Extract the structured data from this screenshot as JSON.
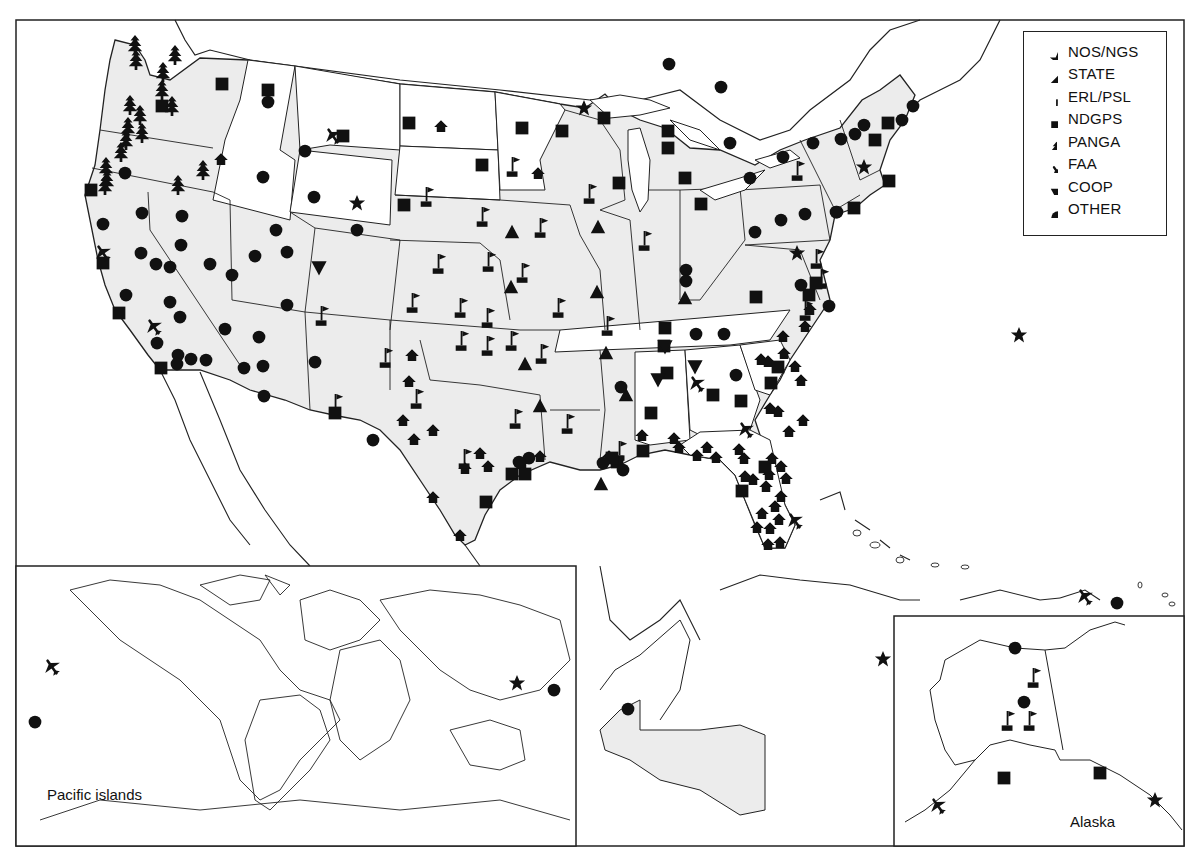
{
  "figure": {
    "frame": {
      "x": 16,
      "y": 20,
      "width": 1168,
      "height": 826
    },
    "colors": {
      "land_shaded": "#ececec",
      "land_unshaded": "#ffffff",
      "outline": "#222222",
      "symbol": "#111111",
      "background": "#ffffff"
    }
  },
  "legend": {
    "items": [
      {
        "key": "nos_ngs",
        "label": "NOS/NGS",
        "icon": "star-icon"
      },
      {
        "key": "state",
        "label": "STATE",
        "icon": "house-icon"
      },
      {
        "key": "erl_psl",
        "label": "ERL/PSL",
        "icon": "flag-icon"
      },
      {
        "key": "ndgps",
        "label": "NDGPS",
        "icon": "square-icon"
      },
      {
        "key": "panga",
        "label": "PANGA",
        "icon": "tree-icon"
      },
      {
        "key": "faa",
        "label": "FAA",
        "icon": "airplane-icon"
      },
      {
        "key": "coop",
        "label": "COOP",
        "icon": "triangle-down-icon"
      },
      {
        "key": "other",
        "label": "OTHER",
        "icon": "circle-icon"
      }
    ]
  },
  "insets": {
    "pacific": {
      "label": "Pacific islands",
      "x": 16,
      "y": 566,
      "width": 560,
      "height": 280
    },
    "alaska": {
      "label": "Alaska",
      "x": 894,
      "y": 616,
      "width": 290,
      "height": 230
    }
  },
  "stations": {
    "nos_ngs": [
      [
        357,
        203
      ],
      [
        584,
        108
      ],
      [
        864,
        167
      ],
      [
        797,
        253
      ],
      [
        1019,
        335
      ],
      [
        883,
        659
      ],
      [
        517,
        683
      ],
      [
        1155,
        800
      ]
    ],
    "state": [
      [
        221,
        160
      ],
      [
        441,
        127
      ],
      [
        538,
        174
      ],
      [
        403,
        421
      ],
      [
        433,
        431
      ],
      [
        409,
        382
      ],
      [
        412,
        356
      ],
      [
        414,
        440
      ],
      [
        480,
        454
      ],
      [
        488,
        467
      ],
      [
        465,
        469
      ],
      [
        460,
        536
      ],
      [
        433,
        498
      ],
      [
        522,
        464
      ],
      [
        540,
        457
      ],
      [
        609,
        457
      ],
      [
        642,
        436
      ],
      [
        674,
        439
      ],
      [
        679,
        448
      ],
      [
        697,
        456
      ],
      [
        707,
        448
      ],
      [
        716,
        458
      ],
      [
        739,
        450
      ],
      [
        744,
        459
      ],
      [
        753,
        480
      ],
      [
        772,
        459
      ],
      [
        769,
        475
      ],
      [
        781,
        467
      ],
      [
        786,
        479
      ],
      [
        778,
        412
      ],
      [
        770,
        409
      ],
      [
        789,
        432
      ],
      [
        803,
        421
      ],
      [
        805,
        327
      ],
      [
        783,
        337
      ],
      [
        784,
        354
      ],
      [
        795,
        367
      ],
      [
        801,
        381
      ],
      [
        810,
        310
      ],
      [
        768,
        362
      ],
      [
        761,
        360
      ],
      [
        766,
        487
      ],
      [
        770,
        529
      ],
      [
        779,
        520
      ],
      [
        768,
        545
      ],
      [
        780,
        543
      ],
      [
        757,
        528
      ],
      [
        762,
        514
      ],
      [
        775,
        507
      ],
      [
        781,
        497
      ],
      [
        745,
        477
      ]
    ],
    "state_triangle": [
      [
        512,
        232
      ],
      [
        598,
        227
      ],
      [
        511,
        287
      ],
      [
        597,
        292
      ],
      [
        525,
        364
      ],
      [
        606,
        353
      ],
      [
        685,
        298
      ],
      [
        626,
        395
      ],
      [
        540,
        406
      ],
      [
        601,
        484
      ]
    ],
    "erl_psl": [
      [
        427,
        196
      ],
      [
        483,
        216
      ],
      [
        541,
        227
      ],
      [
        513,
        166
      ],
      [
        590,
        193
      ],
      [
        645,
        240
      ],
      [
        439,
        263
      ],
      [
        489,
        261
      ],
      [
        413,
        302
      ],
      [
        461,
        307
      ],
      [
        488,
        317
      ],
      [
        523,
        272
      ],
      [
        559,
        307
      ],
      [
        462,
        340
      ],
      [
        488,
        345
      ],
      [
        512,
        340
      ],
      [
        542,
        353
      ],
      [
        608,
        325
      ],
      [
        386,
        357
      ],
      [
        322,
        315
      ],
      [
        336,
        403
      ],
      [
        417,
        398
      ],
      [
        465,
        458
      ],
      [
        516,
        418
      ],
      [
        568,
        423
      ],
      [
        620,
        450
      ],
      [
        1008,
        720
      ],
      [
        1030,
        720
      ],
      [
        1034,
        677
      ],
      [
        798,
        170
      ],
      [
        817,
        258
      ],
      [
        822,
        278
      ],
      [
        806,
        310
      ]
    ],
    "ndgps": [
      [
        222,
        84
      ],
      [
        268,
        90
      ],
      [
        162,
        106
      ],
      [
        343,
        136
      ],
      [
        409,
        123
      ],
      [
        482,
        165
      ],
      [
        522,
        128
      ],
      [
        562,
        131
      ],
      [
        604,
        118
      ],
      [
        619,
        183
      ],
      [
        668,
        131
      ],
      [
        668,
        148
      ],
      [
        685,
        178
      ],
      [
        701,
        204
      ],
      [
        404,
        205
      ],
      [
        91,
        190
      ],
      [
        103,
        263
      ],
      [
        119,
        313
      ],
      [
        161,
        368
      ],
      [
        335,
        413
      ],
      [
        665,
        328
      ],
      [
        664,
        346
      ],
      [
        667,
        373
      ],
      [
        651,
        413
      ],
      [
        643,
        451
      ],
      [
        617,
        462
      ],
      [
        612,
        458
      ],
      [
        512,
        474
      ],
      [
        525,
        474
      ],
      [
        486,
        502
      ],
      [
        756,
        297
      ],
      [
        809,
        295
      ],
      [
        816,
        283
      ],
      [
        713,
        395
      ],
      [
        741,
        401
      ],
      [
        771,
        383
      ],
      [
        778,
        367
      ],
      [
        742,
        491
      ],
      [
        765,
        467
      ],
      [
        888,
        123
      ],
      [
        875,
        140
      ],
      [
        889,
        181
      ],
      [
        854,
        208
      ],
      [
        1004,
        778
      ],
      [
        1100,
        773
      ]
    ],
    "panga": [
      [
        135,
        45
      ],
      [
        136,
        60
      ],
      [
        163,
        72
      ],
      [
        175,
        55
      ],
      [
        140,
        115
      ],
      [
        162,
        90
      ],
      [
        172,
        106
      ],
      [
        126,
        140
      ],
      [
        128,
        127
      ],
      [
        106,
        167
      ],
      [
        107,
        180
      ],
      [
        105,
        185
      ],
      [
        121,
        152
      ],
      [
        142,
        133
      ],
      [
        178,
        185
      ],
      [
        203,
        170
      ],
      [
        130,
        105
      ]
    ],
    "faa": [
      [
        333,
        136
      ],
      [
        154,
        327
      ],
      [
        103,
        253
      ],
      [
        697,
        384
      ],
      [
        746,
        430
      ],
      [
        795,
        521
      ],
      [
        1085,
        597
      ],
      [
        52,
        667
      ],
      [
        938,
        806
      ]
    ],
    "coop": [
      [
        319,
        268
      ],
      [
        665,
        347
      ],
      [
        658,
        380
      ],
      [
        695,
        367
      ]
    ],
    "other": [
      [
        268,
        102
      ],
      [
        305,
        151
      ],
      [
        263,
        177
      ],
      [
        314,
        197
      ],
      [
        357,
        230
      ],
      [
        125,
        173
      ],
      [
        142,
        213
      ],
      [
        182,
        216
      ],
      [
        103,
        224
      ],
      [
        181,
        245
      ],
      [
        141,
        253
      ],
      [
        156,
        264
      ],
      [
        170,
        267
      ],
      [
        210,
        264
      ],
      [
        232,
        275
      ],
      [
        276,
        230
      ],
      [
        287,
        252
      ],
      [
        255,
        256
      ],
      [
        287,
        305
      ],
      [
        126,
        295
      ],
      [
        180,
        317
      ],
      [
        170,
        302
      ],
      [
        225,
        329
      ],
      [
        259,
        337
      ],
      [
        263,
        366
      ],
      [
        315,
        362
      ],
      [
        157,
        343
      ],
      [
        178,
        355
      ],
      [
        191,
        359
      ],
      [
        177,
        364
      ],
      [
        206,
        360
      ],
      [
        244,
        368
      ],
      [
        264,
        396
      ],
      [
        373,
        440
      ],
      [
        669,
        64
      ],
      [
        721,
        87
      ],
      [
        730,
        143
      ],
      [
        750,
        178
      ],
      [
        783,
        157
      ],
      [
        813,
        143
      ],
      [
        841,
        139
      ],
      [
        855,
        134
      ],
      [
        864,
        125
      ],
      [
        902,
        120
      ],
      [
        913,
        106
      ],
      [
        755,
        232
      ],
      [
        781,
        220
      ],
      [
        805,
        214
      ],
      [
        837,
        212
      ],
      [
        801,
        285
      ],
      [
        829,
        306
      ],
      [
        686,
        270
      ],
      [
        686,
        281
      ],
      [
        696,
        334
      ],
      [
        724,
        334
      ],
      [
        736,
        375
      ],
      [
        621,
        387
      ],
      [
        603,
        463
      ],
      [
        623,
        470
      ],
      [
        529,
        458
      ],
      [
        519,
        462
      ],
      [
        836,
        212
      ],
      [
        1117,
        603
      ],
      [
        1015,
        648
      ],
      [
        1024,
        702
      ],
      [
        35,
        722
      ],
      [
        554,
        690
      ],
      [
        628,
        709
      ]
    ],
    "nos_ngs_note": "stars"
  },
  "states_unshaded": [
    "Idaho",
    "Montana",
    "Wyoming",
    "North Dakota",
    "South Dakota",
    "Minnesota",
    "Tennessee",
    "Alabama",
    "Georgia",
    "South Carolina",
    "North Carolina",
    "Florida"
  ]
}
